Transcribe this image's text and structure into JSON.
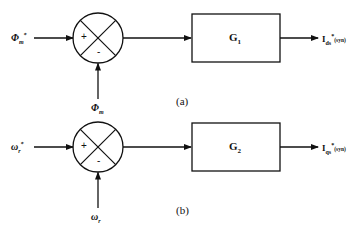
{
  "diagrams": [
    {
      "id": "a",
      "caption": "(a)",
      "reference_input": {
        "symbol": "Φ",
        "subscript": "m",
        "superscript": "*"
      },
      "feedback_input": {
        "symbol": "Φ",
        "subscript": "m"
      },
      "summing_junction": {
        "plus_sign": "+",
        "minus_sign": "-"
      },
      "block": {
        "symbol": "G",
        "subscript": "1"
      },
      "output": {
        "symbol": "I",
        "subscript": "ds",
        "superscript": "*",
        "frame": "(syn)"
      }
    },
    {
      "id": "b",
      "caption": "(b)",
      "reference_input": {
        "symbol": "ω",
        "subscript": "r",
        "superscript": "*"
      },
      "feedback_input": {
        "symbol": "ω",
        "subscript": "r"
      },
      "summing_junction": {
        "plus_sign": "+",
        "minus_sign": "-"
      },
      "block": {
        "symbol": "G",
        "subscript": "2"
      },
      "output": {
        "symbol": "I",
        "subscript": "qs",
        "superscript": "*",
        "frame": "(syn)"
      }
    }
  ],
  "colors": {
    "line": "#111111",
    "background": "#ffffff"
  }
}
